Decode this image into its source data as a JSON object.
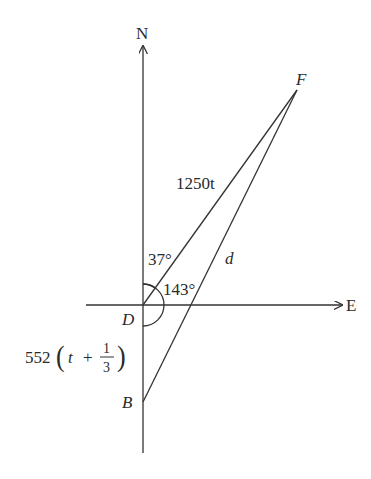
{
  "diagram": {
    "type": "bearing-triangle",
    "axes": {
      "north_label": "N",
      "east_label": "E"
    },
    "points": {
      "D": {
        "label": "D",
        "x": 143,
        "y": 305
      },
      "F": {
        "label": "F",
        "x": 297,
        "y": 90
      },
      "B": {
        "label": "B",
        "x": 143,
        "y": 402
      }
    },
    "segments": {
      "DF": {
        "label": "1250t"
      },
      "BF": {
        "label": "d"
      },
      "DB": {
        "label_main": "552",
        "label_var": "t",
        "label_plus": "+",
        "frac_num": "1",
        "frac_den": "3"
      }
    },
    "angles": {
      "NDF": {
        "label": "37°"
      },
      "FDB": {
        "label": "143°"
      }
    }
  }
}
